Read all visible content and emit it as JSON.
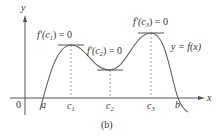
{
  "figure": {
    "caption": "(b)",
    "axes": {
      "x_label": "x",
      "y_label": "y",
      "origin_label": "0"
    },
    "points": {
      "a": "a",
      "b": "b",
      "c1": "c",
      "c1_sub": "1",
      "c2": "c",
      "c2_sub": "2",
      "c3": "c",
      "c3_sub": "3"
    },
    "annotations": {
      "deriv1_prefix": "f′(c",
      "deriv1_sub": "1",
      "deriv1_suffix": ") = 0",
      "deriv2_prefix": "f′(c",
      "deriv2_sub": "2",
      "deriv2_suffix": ") = 0",
      "deriv3_prefix": "f′(c",
      "deriv3_sub": "3",
      "deriv3_suffix": ") = 0",
      "curve_label": "y = f(x)"
    },
    "colors": {
      "curve": "#666666",
      "tangent": "#555555",
      "axis": "#555555",
      "dashed": "#888888",
      "text": "#333333"
    }
  }
}
